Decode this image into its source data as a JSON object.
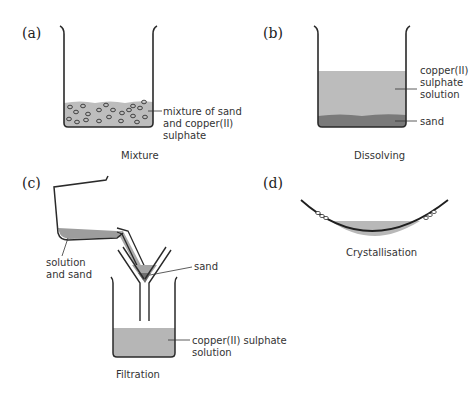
{
  "panels": {
    "a": {
      "label": "(a)",
      "caption": "Mixture",
      "annotation": [
        "mixture of sand",
        "and copper(II)",
        "sulphate"
      ]
    },
    "b": {
      "label": "(b)",
      "caption": "Dissolving",
      "annotation_solution": [
        "copper(II)",
        "sulphate",
        "solution"
      ],
      "annotation_sand": "sand"
    },
    "c": {
      "label": "(c)",
      "caption": "Filtration",
      "annotation_beaker": [
        "solution",
        "and sand"
      ],
      "annotation_funnel": "sand",
      "annotation_filtrate": [
        "copper(II) sulphate",
        "solution"
      ]
    },
    "d": {
      "label": "(d)",
      "caption": "Crystallisation"
    }
  },
  "colors": {
    "solution": "#b9b9b9",
    "sand": "#7d7d7d",
    "outline": "#2a2a2a"
  }
}
